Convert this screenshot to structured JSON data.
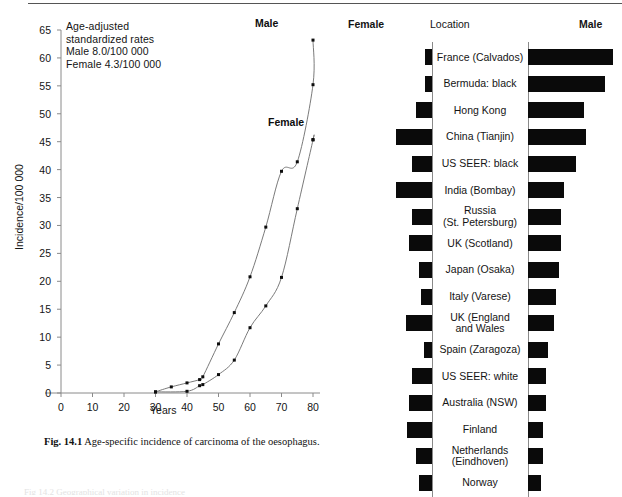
{
  "page": {
    "top_rule": true
  },
  "left_figure": {
    "annotation": "Age-adjusted\nstandardized rates\nMale 8.0/100 000\nFemale 4.3/100 000",
    "series_labels": {
      "male": "Male",
      "female": "Female"
    },
    "caption_prefix": "Fig. 14.1",
    "caption_text": "Age-specific incidence of carcinoma of the oesophagus."
  },
  "right_figure": {
    "header_female": "Female",
    "header_location": "Location",
    "header_male": "Male"
  },
  "bottom_ghost_text": "Fig 14.2  Geographical variation in incidence",
  "chart_data": [
    {
      "type": "line",
      "id": "age-specific-incidence",
      "title": "Age-specific incidence of carcinoma of the oesophagus",
      "xlabel": "Years",
      "ylabel": "Incidence/100 000",
      "xlim": [
        0,
        80
      ],
      "ylim": [
        0,
        65
      ],
      "xticks": [
        0,
        10,
        20,
        30,
        40,
        50,
        60,
        70,
        80
      ],
      "yticks": [
        0,
        5,
        10,
        15,
        20,
        25,
        30,
        35,
        40,
        45,
        50,
        55,
        60,
        65
      ],
      "grid": false,
      "legend": "inline-labels",
      "annotations": [
        "Age-adjusted standardized rates",
        "Male 8.0/100 000",
        "Female 4.3/100 000"
      ],
      "series": [
        {
          "name": "Male",
          "x": [
            30,
            35,
            40,
            44,
            45,
            50,
            55,
            60,
            65,
            70,
            75,
            80
          ],
          "y": [
            0.2,
            1.1,
            1.8,
            2.4,
            2.9,
            8.8,
            14.4,
            20.8,
            29.7,
            39.7,
            41.4,
            55.2
          ]
        },
        {
          "name": "Female",
          "x": [
            30,
            40,
            44,
            45,
            50,
            55,
            60,
            65,
            70,
            75,
            80
          ],
          "y": [
            0.2,
            0.3,
            1.3,
            1.5,
            3.3,
            5.9,
            11.7,
            15.6,
            20.7,
            33.0,
            45.3
          ]
        }
      ],
      "extra_points": {
        "male_top": {
          "x": 80,
          "y": 63.2
        },
        "female_top": {
          "x": 80,
          "y": 45.4
        }
      }
    },
    {
      "type": "bar",
      "id": "geographic-variation",
      "orientation": "horizontal-diverging",
      "left_series": "Female",
      "right_series": "Male",
      "center_column": "Location",
      "categories": [
        "France (Calvados)",
        "Bermuda: black",
        "Hong Kong",
        "China (Tianjin)",
        "US SEER: black",
        "India (Bombay)",
        "Russia\n(St. Petersburg)",
        "UK (Scotland)",
        "Japan (Osaka)",
        "Italy (Varese)",
        "UK (England\nand Wales",
        "Spain (Zaragoza)",
        "US SEER: white",
        "Australia (NSW)",
        "Finland",
        "Netherlands\n(Eindhoven)",
        "Norway"
      ],
      "series": [
        {
          "name": "Female",
          "values": [
            2.0,
            2.0,
            5.0,
            11.0,
            6.0,
            11.0,
            6.0,
            7.0,
            4.0,
            3.5,
            8.0,
            2.5,
            6.0,
            7.0,
            7.5,
            5.0,
            4.0
          ]
        },
        {
          "name": "Male",
          "values": [
            26.0,
            23.5,
            17.0,
            17.5,
            14.5,
            11.0,
            10.0,
            10.0,
            9.5,
            8.5,
            8.0,
            6.0,
            5.5,
            5.5,
            4.5,
            4.5,
            4.0
          ]
        }
      ],
      "female_axis_at": 0,
      "male_axis_at": 0
    }
  ]
}
